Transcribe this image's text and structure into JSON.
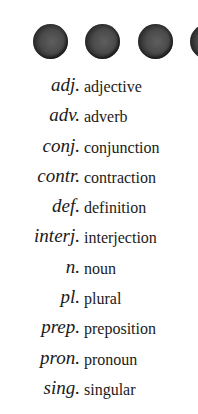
{
  "decoration": {
    "dots": [
      {
        "left": 33
      },
      {
        "left": 85
      },
      {
        "left": 138
      },
      {
        "left": 190
      }
    ]
  },
  "abbreviations": [
    {
      "abbr": "adj.",
      "term": "adjective"
    },
    {
      "abbr": "adv.",
      "term": "adverb"
    },
    {
      "abbr": "conj.",
      "term": "conjunction"
    },
    {
      "abbr": "contr.",
      "term": "contraction"
    },
    {
      "abbr": "def.",
      "term": "definition"
    },
    {
      "abbr": "interj.",
      "term": "interjection"
    },
    {
      "abbr": "n.",
      "term": "noun"
    },
    {
      "abbr": "pl.",
      "term": "plural"
    },
    {
      "abbr": "prep.",
      "term": "preposition"
    },
    {
      "abbr": "pron.",
      "term": "pronoun"
    },
    {
      "abbr": "sing.",
      "term": "singular"
    }
  ]
}
